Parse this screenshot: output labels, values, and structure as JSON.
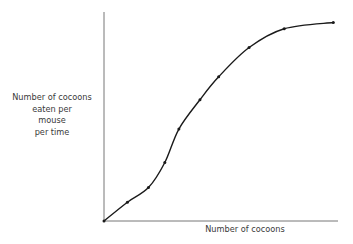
{
  "chart_data": {
    "type": "line",
    "title": "",
    "xlabel": "Number of cocoons",
    "ylabel": "Number of cocoons eaten per mouse per time",
    "ylabel_lines": [
      "Number of cocoons",
      "eaten per",
      "mouse",
      "per time"
    ],
    "x_ticks": [],
    "y_ticks": [],
    "grid": false,
    "legend": null,
    "xlim": [
      0,
      100
    ],
    "ylim": [
      0,
      100
    ],
    "series": [
      {
        "name": "functional response (sigmoid, type III)",
        "style": "smooth curve with point markers",
        "color": "#1a1a1a",
        "x": [
          0,
          10,
          19,
          26,
          32,
          41,
          49,
          62,
          77,
          98
        ],
        "y": [
          0,
          9,
          16,
          28,
          44,
          58,
          69,
          83,
          92,
          95
        ]
      }
    ]
  }
}
